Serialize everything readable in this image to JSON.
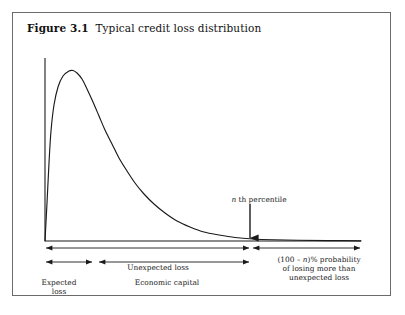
{
  "figure": {
    "number": "Figure 3.1",
    "caption": "Typical credit loss distribution",
    "frame_color": "#6b6b6b",
    "background": "#ffffff",
    "line_color": "#1a1a1a"
  },
  "annotations": {
    "percentile": "n th percentile",
    "percentile_parts": {
      "variable": "n",
      "rest": "th percentile"
    },
    "unexpected_loss": "Unexpected loss",
    "expected_loss_line1": "Expected",
    "expected_loss_line2": "loss",
    "economic_capital": "Economic capital",
    "tail_line1_pre": "(100 – ",
    "tail_line1_var": "n",
    "tail_line1_post": ")% probability",
    "tail_line2": "of losing more than",
    "tail_line3": "unexpected loss"
  },
  "chart_data": {
    "type": "line",
    "title": "Typical credit loss distribution",
    "xlabel": "",
    "ylabel": "",
    "grid": false,
    "legend": "none",
    "axes": {
      "y_axis_x_px": 32,
      "baseline_y_px": 228,
      "y_axis_top_px": 45,
      "x_end_px": 348
    },
    "series": [
      {
        "name": "credit loss density",
        "points_px": [
          [
            32,
            228
          ],
          [
            34,
            190
          ],
          [
            36,
            150
          ],
          [
            38,
            118
          ],
          [
            41,
            92
          ],
          [
            45,
            74
          ],
          [
            50,
            63
          ],
          [
            56,
            58
          ],
          [
            60,
            57.5
          ],
          [
            64,
            60
          ],
          [
            69,
            66
          ],
          [
            74,
            76
          ],
          [
            80,
            89
          ],
          [
            86,
            103
          ],
          [
            92,
            117
          ],
          [
            99,
            131
          ],
          [
            106,
            145
          ],
          [
            114,
            158
          ],
          [
            122,
            170
          ],
          [
            131,
            181
          ],
          [
            141,
            191
          ],
          [
            152,
            200
          ],
          [
            164,
            208
          ],
          [
            177,
            214
          ],
          [
            191,
            219
          ],
          [
            206,
            222
          ],
          [
            222,
            224.5
          ],
          [
            240,
            226
          ],
          [
            260,
            226.8
          ],
          [
            285,
            227.3
          ],
          [
            315,
            227.6
          ],
          [
            348,
            227.8
          ]
        ]
      }
    ],
    "markers": {
      "percentile_x_px": 237,
      "percentile_arrow_top_px": 191,
      "percentile_arrow_bottom_px": 228
    },
    "spans": [
      {
        "name": "unexpected-loss",
        "label": "Unexpected loss",
        "x_start_px": 32,
        "x_end_px": 237,
        "row_y_px": 235,
        "arrow_start": true,
        "arrow_end": true
      },
      {
        "name": "tail-probability",
        "label": "(100 – n)% probability of losing more than unexpected loss",
        "x_start_px": 239,
        "x_end_px": 348,
        "row_y_px": 235,
        "arrow_start": true,
        "arrow_end": true
      },
      {
        "name": "expected-loss",
        "label": "Expected loss",
        "x_start_px": 32,
        "x_end_px": 80,
        "row_y_px": 249,
        "arrow_start": true,
        "arrow_end": true
      },
      {
        "name": "economic-capital",
        "label": "Economic capital",
        "x_start_px": 85,
        "x_end_px": 237,
        "row_y_px": 249,
        "arrow_start": true,
        "arrow_end": true
      }
    ]
  }
}
